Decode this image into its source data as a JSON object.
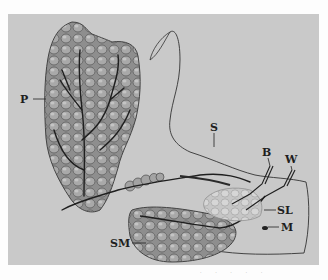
{
  "figure": {
    "background_color": "#c9c9c9",
    "gland_color": "#8a8a8a",
    "duct_color": "#222222",
    "labels": [
      {
        "id": "P",
        "text": "P",
        "x": 24,
        "y": 103
      },
      {
        "id": "S",
        "text": "S",
        "x": 214,
        "y": 130
      },
      {
        "id": "B",
        "text": "B",
        "x": 266,
        "y": 155
      },
      {
        "id": "W",
        "text": "W",
        "x": 288,
        "y": 163
      },
      {
        "id": "SL",
        "text": "SL",
        "x": 277,
        "y": 213
      },
      {
        "id": "M",
        "text": "M",
        "x": 281,
        "y": 230
      },
      {
        "id": "SM",
        "text": "SM",
        "x": 111,
        "y": 247
      }
    ]
  },
  "caption": ". . . . ."
}
